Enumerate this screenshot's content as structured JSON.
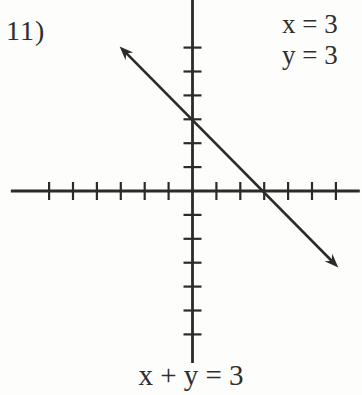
{
  "page": {
    "background": "#fdfdfc",
    "ink": "#2b2b2b",
    "text_color": "#2e2e2e"
  },
  "problem": {
    "number_label": "11)",
    "answer_lines": [
      "x = 3",
      "y = 3"
    ],
    "equation_label": "x + y = 3"
  },
  "chart_data": {
    "type": "line",
    "title": "",
    "xlabel": "",
    "ylabel": "",
    "equation": "x + y = 3",
    "slope": -1,
    "x_intercept": 3,
    "y_intercept": 3,
    "solution": {
      "x": 3,
      "y": 3
    },
    "axes": {
      "x_range": [
        -7.6,
        7.0
      ],
      "y_range": [
        -7.2,
        8.0
      ],
      "x_ticks": [
        -6,
        -5,
        -4,
        -3,
        -2,
        -1,
        1,
        2,
        3,
        4,
        5,
        6
      ],
      "y_ticks": [
        -6,
        -5,
        -4,
        -3,
        -2,
        -1,
        1,
        2,
        3,
        4,
        5,
        6
      ],
      "tick_labels_shown": false,
      "grid": false
    },
    "series": [
      {
        "name": "x + y = 3",
        "points": [
          {
            "x": -3.05,
            "y": 6.05
          },
          {
            "x": 6.1,
            "y": -3.2
          }
        ],
        "arrowheads": "both"
      }
    ],
    "legend": {
      "shown": false
    }
  }
}
